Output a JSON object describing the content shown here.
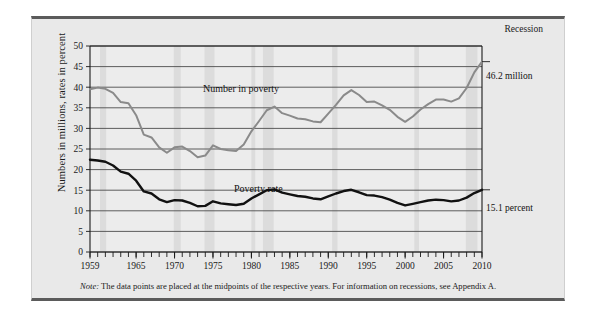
{
  "figure": {
    "recession_label": "Recession",
    "note_prefix": "Note:",
    "note_text": " The data points are placed at the midpoints of the respective years. For information on recessions, see Appendix A.",
    "callout_number": "46.2 million",
    "callout_rate": "15.1 percent",
    "label_number": "Number in poverty",
    "label_rate": "Poverty rate"
  },
  "colors": {
    "panel_background": "#e9e9e9",
    "plot_background": "#ececec",
    "number_series": "#8a8a8a",
    "rate_series": "#111111",
    "gridline": "#4d4d4d",
    "recession_band": "#dcdcdc",
    "frame": "#5b5b5b"
  },
  "chart_data": {
    "type": "line",
    "title": "",
    "xlabel": "",
    "ylabel": "Numbers in millions, rates in percent",
    "xlim": [
      1959,
      2010
    ],
    "ylim": [
      0,
      50
    ],
    "ytick_step": 5,
    "grid": true,
    "legend": "inline-annotations",
    "yticks": [
      0,
      5,
      10,
      15,
      20,
      25,
      30,
      35,
      40,
      45,
      50
    ],
    "xticks_labeled": [
      1959,
      1965,
      1970,
      1975,
      1980,
      1985,
      1990,
      1995,
      2000,
      2005,
      2010
    ],
    "xticks_minor_every": 1,
    "x": [
      1959,
      1960,
      1961,
      1962,
      1963,
      1964,
      1965,
      1966,
      1967,
      1968,
      1969,
      1970,
      1971,
      1972,
      1973,
      1974,
      1975,
      1976,
      1977,
      1978,
      1979,
      1980,
      1981,
      1982,
      1983,
      1984,
      1985,
      1986,
      1987,
      1988,
      1989,
      1990,
      1991,
      1992,
      1993,
      1994,
      1995,
      1996,
      1997,
      1998,
      1999,
      2000,
      2001,
      2002,
      2003,
      2004,
      2005,
      2006,
      2007,
      2008,
      2009,
      2010
    ],
    "series": [
      {
        "name": "Number in poverty",
        "units": "millions",
        "color": "#8a8a8a",
        "end_annotation": "46.2 million",
        "values": [
          39.5,
          39.9,
          39.6,
          38.6,
          36.4,
          36.1,
          33.2,
          28.5,
          27.8,
          25.4,
          24.1,
          25.4,
          25.6,
          24.5,
          23.0,
          23.4,
          25.9,
          25.0,
          24.7,
          24.5,
          26.1,
          29.3,
          31.8,
          34.4,
          35.3,
          33.7,
          33.1,
          32.4,
          32.2,
          31.7,
          31.5,
          33.6,
          35.7,
          38.0,
          39.3,
          38.1,
          36.4,
          36.5,
          35.6,
          34.5,
          32.8,
          31.6,
          32.9,
          34.6,
          35.9,
          37.0,
          37.0,
          36.5,
          37.3,
          39.8,
          43.6,
          46.2
        ]
      },
      {
        "name": "Poverty rate",
        "units": "percent",
        "color": "#111111",
        "end_annotation": "15.1 percent",
        "values": [
          22.4,
          22.2,
          21.9,
          21.0,
          19.5,
          19.0,
          17.3,
          14.7,
          14.2,
          12.8,
          12.1,
          12.6,
          12.5,
          11.9,
          11.1,
          11.2,
          12.3,
          11.8,
          11.6,
          11.4,
          11.7,
          13.0,
          14.0,
          15.0,
          15.2,
          14.4,
          14.0,
          13.6,
          13.4,
          13.0,
          12.8,
          13.5,
          14.2,
          14.8,
          15.1,
          14.5,
          13.8,
          13.7,
          13.3,
          12.7,
          11.9,
          11.3,
          11.7,
          12.1,
          12.5,
          12.7,
          12.6,
          12.3,
          12.5,
          13.2,
          14.3,
          15.1
        ]
      }
    ],
    "recession_bands": [
      [
        1960.3,
        1961.1
      ],
      [
        1969.9,
        1970.8
      ],
      [
        1973.9,
        1975.2
      ],
      [
        1980.0,
        1980.5
      ],
      [
        1981.5,
        1982.9
      ],
      [
        1990.5,
        1991.2
      ],
      [
        2001.2,
        2001.8
      ],
      [
        2007.9,
        2009.4
      ]
    ]
  }
}
